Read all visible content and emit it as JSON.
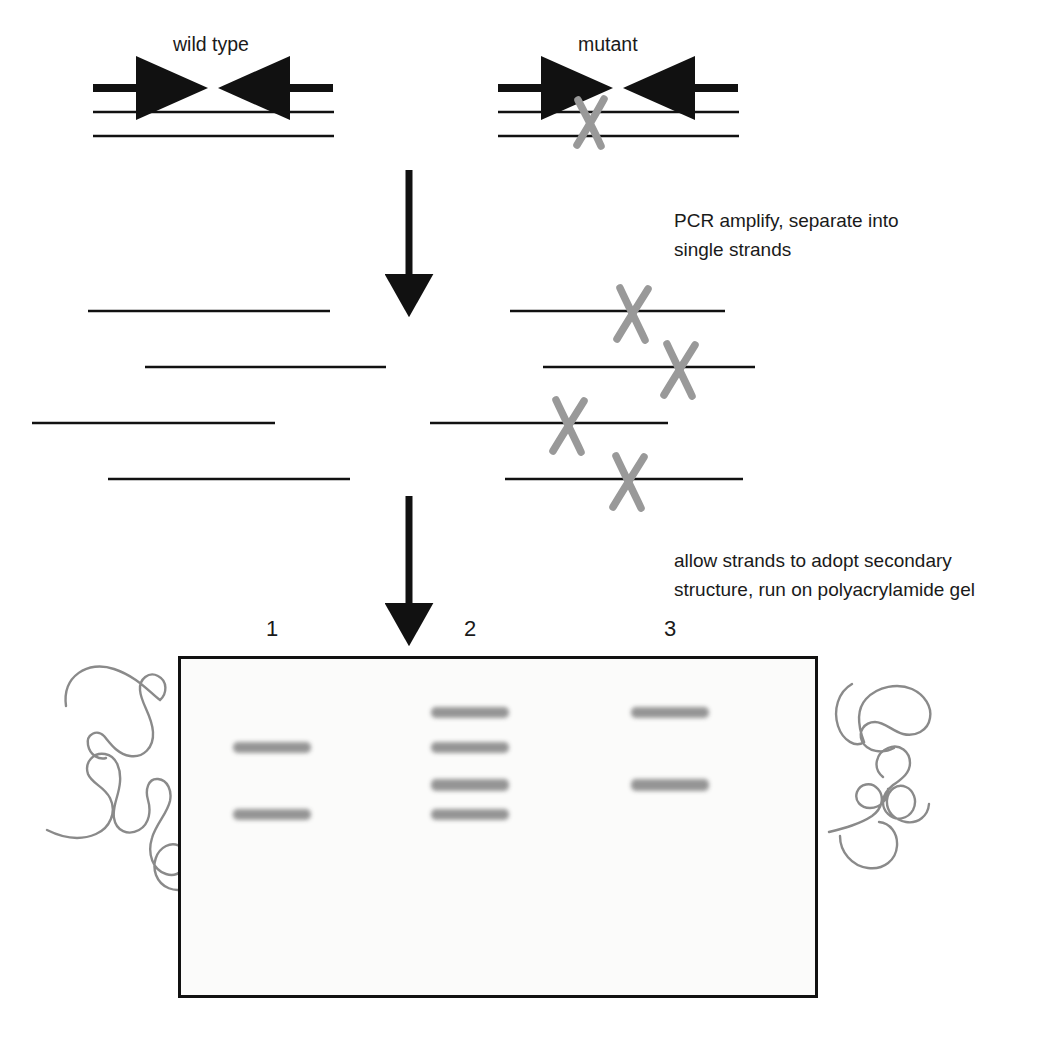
{
  "figure": {
    "colors": {
      "ink": "#1a1a1a",
      "strand": "#111111",
      "mutation_x": "#999999",
      "squiggle": "#8a8a8a",
      "band": "#8d8d8d",
      "gel_background": "#fbfbfa",
      "gel_border": "#111111"
    }
  },
  "panels": {
    "wild_type_label": "wild type",
    "mutant_label": "mutant"
  },
  "steps": {
    "step1_note": "PCR amplify, separate into\nsingle strands",
    "step1_line1": "PCR amplify, separate into",
    "step1_line2": "single strands",
    "step2_note": "allow strands to adopt secondary\nstructure, run on polyacrylamide gel",
    "step2_line1": "allow strands to adopt secondary",
    "step2_line2": "structure, run on polyacrylamide gel"
  },
  "duplex": {
    "wild_type": {
      "forward_primer": "forward-primer-arrow",
      "reverse_primer": "reverse-primer-arrow",
      "top_strand": "top-strand",
      "bottom_strand": "bottom-strand",
      "mutation": false
    },
    "mutant": {
      "forward_primer": "forward-primer-arrow",
      "reverse_primer": "reverse-primer-arrow",
      "top_strand": "top-strand",
      "bottom_strand": "bottom-strand",
      "mutation": true
    }
  },
  "single_strands": {
    "wild_type_count": 4,
    "mutant_count": 4,
    "wild_type": [
      {
        "x1": 88,
        "x2": 330,
        "y": 311,
        "mutation_x": null
      },
      {
        "x1": 145,
        "x2": 386,
        "y": 367,
        "mutation_x": null
      },
      {
        "x1": 32,
        "x2": 275,
        "y": 423,
        "mutation_x": null
      },
      {
        "x1": 108,
        "x2": 350,
        "y": 479,
        "mutation_x": null
      }
    ],
    "mutant": [
      {
        "x1": 510,
        "x2": 725,
        "y": 311,
        "mutation_x": 632
      },
      {
        "x1": 543,
        "x2": 755,
        "y": 367,
        "mutation_x": 679
      },
      {
        "x1": 430,
        "x2": 668,
        "y": 423,
        "mutation_x": 568
      },
      {
        "x1": 505,
        "x2": 743,
        "y": 479,
        "mutation_x": 628
      }
    ]
  },
  "gel": {
    "frame": {
      "left": 178,
      "top": 656,
      "width": 634,
      "height": 336
    },
    "lanes": [
      {
        "number": "1",
        "label_x": 272,
        "center_x": 272,
        "bands": [
          {
            "y": 745,
            "width": 78,
            "height": 11
          },
          {
            "y": 812,
            "width": 78,
            "height": 11
          }
        ]
      },
      {
        "number": "2",
        "label_x": 470,
        "center_x": 470,
        "bands": [
          {
            "y": 710,
            "width": 78,
            "height": 11
          },
          {
            "y": 745,
            "width": 78,
            "height": 11
          },
          {
            "y": 782,
            "width": 78,
            "height": 12
          },
          {
            "y": 812,
            "width": 78,
            "height": 11
          }
        ]
      },
      {
        "number": "3",
        "label_x": 670,
        "center_x": 670,
        "bands": [
          {
            "y": 710,
            "width": 78,
            "height": 11
          },
          {
            "y": 782,
            "width": 78,
            "height": 12
          }
        ]
      }
    ]
  },
  "conformers": {
    "left_count": 2,
    "right_count": 2,
    "description": "single-stranded DNA secondary structure conformers"
  },
  "arrows": {
    "step1_arrow": {
      "x": 409,
      "y1": 170,
      "y2": 291
    },
    "step2_arrow": {
      "x": 409,
      "y1": 496,
      "y2": 620
    }
  }
}
